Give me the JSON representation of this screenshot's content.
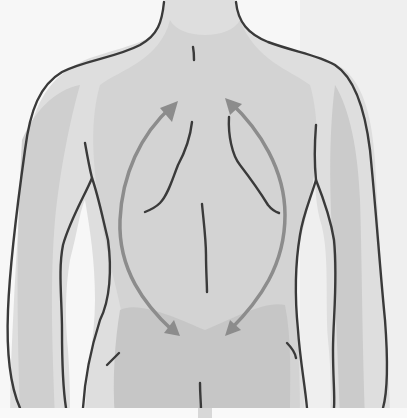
{
  "figure": {
    "arrows": [
      {
        "id": "left-arrow",
        "direction": "bidirectional",
        "from": "upper-left scapula",
        "to": "lower-left back"
      },
      {
        "id": "right-arrow",
        "direction": "bidirectional",
        "from": "upper-right scapula",
        "to": "lower-right back"
      }
    ],
    "colors": {
      "background": "#f7f7f7",
      "skin_light": "#e2e2e2",
      "skin_mid": "#d3d3d3",
      "skin_dark": "#c4c4c4",
      "outline": "#3a3a3a",
      "arrow": "#8c8c8c"
    }
  }
}
